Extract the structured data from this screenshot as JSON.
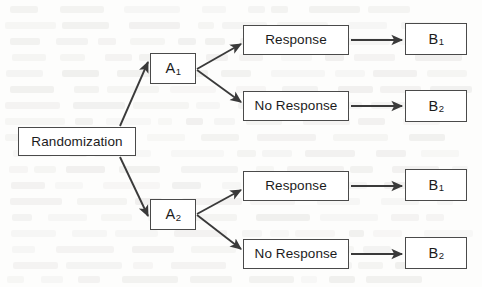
{
  "diagram": {
    "type": "flowchart",
    "orientation": "left-to-right",
    "colors": {
      "box_border": "#4a4a4a",
      "box_fill": "#ffffff",
      "arrow": "#3a3a3a",
      "text": "#1b1b1b",
      "page": "#fdfdfc"
    },
    "nodes": [
      {
        "id": "root",
        "label": "Randomization",
        "sub": "",
        "x": 18,
        "y": 127,
        "w": 118,
        "h": 29,
        "kind": "root"
      },
      {
        "id": "a1",
        "label": "A",
        "sub": "1",
        "x": 150,
        "y": 53,
        "w": 46,
        "h": 31,
        "kind": "sym"
      },
      {
        "id": "a2",
        "label": "A",
        "sub": "2",
        "x": 150,
        "y": 199,
        "w": 46,
        "h": 31,
        "kind": "sym"
      },
      {
        "id": "r1",
        "label": "Response",
        "sub": "",
        "x": 243,
        "y": 25,
        "w": 106,
        "h": 30,
        "kind": "text"
      },
      {
        "id": "nr1",
        "label": "No Response",
        "sub": "",
        "x": 243,
        "y": 91,
        "w": 106,
        "h": 30,
        "kind": "text"
      },
      {
        "id": "r2",
        "label": "Response",
        "sub": "",
        "x": 243,
        "y": 171,
        "w": 106,
        "h": 30,
        "kind": "text"
      },
      {
        "id": "nr2",
        "label": "No Response",
        "sub": "",
        "x": 243,
        "y": 239,
        "w": 106,
        "h": 30,
        "kind": "text"
      },
      {
        "id": "b1top",
        "label": "B",
        "sub": "1",
        "x": 405,
        "y": 23,
        "w": 62,
        "h": 32,
        "kind": "sym"
      },
      {
        "id": "b2top",
        "label": "B",
        "sub": "2",
        "x": 405,
        "y": 90,
        "w": 62,
        "h": 32,
        "kind": "sym"
      },
      {
        "id": "b1bot",
        "label": "B",
        "sub": "1",
        "x": 405,
        "y": 169,
        "w": 62,
        "h": 32,
        "kind": "sym"
      },
      {
        "id": "b2bot",
        "label": "B",
        "sub": "2",
        "x": 405,
        "y": 237,
        "w": 62,
        "h": 32,
        "kind": "sym"
      }
    ],
    "edges": [
      {
        "id": "e-root-a1",
        "from": "root",
        "to": "a1",
        "x1": 120,
        "y1": 126,
        "x2": 148,
        "y2": 62
      },
      {
        "id": "e-root-a2",
        "from": "root",
        "to": "a2",
        "x1": 120,
        "y1": 157,
        "x2": 148,
        "y2": 216
      },
      {
        "id": "e-a1-r1",
        "from": "a1",
        "to": "r1",
        "x1": 197,
        "y1": 69,
        "x2": 241,
        "y2": 44
      },
      {
        "id": "e-a1-nr1",
        "from": "a1",
        "to": "nr1",
        "x1": 197,
        "y1": 70,
        "x2": 241,
        "y2": 102
      },
      {
        "id": "e-a2-r2",
        "from": "a2",
        "to": "r2",
        "x1": 197,
        "y1": 214,
        "x2": 241,
        "y2": 190
      },
      {
        "id": "e-a2-nr2",
        "from": "a2",
        "to": "nr2",
        "x1": 197,
        "y1": 215,
        "x2": 241,
        "y2": 249
      },
      {
        "id": "e-r1-b1",
        "from": "r1",
        "to": "b1top",
        "x1": 351,
        "y1": 40,
        "x2": 402,
        "y2": 40
      },
      {
        "id": "e-nr1-b2",
        "from": "nr1",
        "to": "b2top",
        "x1": 351,
        "y1": 106,
        "x2": 402,
        "y2": 106
      },
      {
        "id": "e-r2-b1",
        "from": "r2",
        "to": "b1bot",
        "x1": 351,
        "y1": 186,
        "x2": 402,
        "y2": 186
      },
      {
        "id": "e-nr2-b2",
        "from": "nr2",
        "to": "b2bot",
        "x1": 351,
        "y1": 254,
        "x2": 402,
        "y2": 254
      }
    ]
  }
}
